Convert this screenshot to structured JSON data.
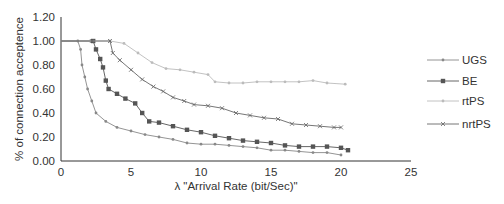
{
  "chart_data": {
    "type": "line",
    "title": "",
    "xlabel": "λ \"Arrival Rate (bit/Sec)\"",
    "ylabel": "% of connection acceptence",
    "xlim": [
      0,
      25
    ],
    "ylim": [
      0,
      1.2
    ],
    "x_ticks": [
      "0",
      "5",
      "10",
      "15",
      "20",
      "25"
    ],
    "y_ticks": [
      "0.00",
      "0.20",
      "0.40",
      "0.60",
      "0.80",
      "1.00",
      "1.20"
    ],
    "grid": false,
    "legend_position": "right",
    "series": [
      {
        "name": "UGS",
        "color": "#888888",
        "marker": "dot",
        "points": [
          [
            0,
            1.0
          ],
          [
            1.2,
            1.0
          ],
          [
            1.4,
            0.93
          ],
          [
            1.5,
            0.8
          ],
          [
            1.7,
            0.7
          ],
          [
            1.9,
            0.6
          ],
          [
            2.2,
            0.5
          ],
          [
            2.5,
            0.4
          ],
          [
            3.2,
            0.33
          ],
          [
            4,
            0.28
          ],
          [
            5,
            0.25
          ],
          [
            6,
            0.22
          ],
          [
            7,
            0.2
          ],
          [
            8,
            0.18
          ],
          [
            9,
            0.15
          ],
          [
            10,
            0.14
          ],
          [
            11,
            0.14
          ],
          [
            12,
            0.13
          ],
          [
            13,
            0.12
          ],
          [
            14,
            0.11
          ],
          [
            15,
            0.09
          ],
          [
            16,
            0.09
          ],
          [
            17,
            0.08
          ],
          [
            18,
            0.07
          ],
          [
            19,
            0.07
          ],
          [
            20,
            0.05
          ]
        ]
      },
      {
        "name": "BE",
        "color": "#555555",
        "marker": "square",
        "points": [
          [
            0,
            1.0
          ],
          [
            2.3,
            1.0
          ],
          [
            2.5,
            0.93
          ],
          [
            2.8,
            0.85
          ],
          [
            3.0,
            0.78
          ],
          [
            3.2,
            0.67
          ],
          [
            3.4,
            0.6
          ],
          [
            4.0,
            0.56
          ],
          [
            4.6,
            0.52
          ],
          [
            5.3,
            0.48
          ],
          [
            5.8,
            0.4
          ],
          [
            6.3,
            0.33
          ],
          [
            7,
            0.32
          ],
          [
            8,
            0.29
          ],
          [
            9,
            0.26
          ],
          [
            10,
            0.24
          ],
          [
            11,
            0.21
          ],
          [
            12,
            0.19
          ],
          [
            13,
            0.17
          ],
          [
            14,
            0.16
          ],
          [
            15,
            0.15
          ],
          [
            16,
            0.13
          ],
          [
            17,
            0.12
          ],
          [
            18,
            0.12
          ],
          [
            19,
            0.12
          ],
          [
            20,
            0.11
          ],
          [
            20.5,
            0.09
          ]
        ]
      },
      {
        "name": "rtPS",
        "color": "#bbbbbb",
        "marker": "dot",
        "points": [
          [
            0,
            1.0
          ],
          [
            3.5,
            1.0
          ],
          [
            4.5,
            0.98
          ],
          [
            5.5,
            0.9
          ],
          [
            6.5,
            0.82
          ],
          [
            7.5,
            0.77
          ],
          [
            8.5,
            0.76
          ],
          [
            9.5,
            0.74
          ],
          [
            10.5,
            0.72
          ],
          [
            11,
            0.66
          ],
          [
            12,
            0.65
          ],
          [
            13,
            0.65
          ],
          [
            14,
            0.66
          ],
          [
            15,
            0.66
          ],
          [
            16,
            0.66
          ],
          [
            17,
            0.66
          ],
          [
            18,
            0.67
          ],
          [
            19,
            0.65
          ],
          [
            20.3,
            0.64
          ]
        ]
      },
      {
        "name": "nrtPS",
        "color": "#666666",
        "marker": "x",
        "points": [
          [
            0,
            1.0
          ],
          [
            2.2,
            1.0
          ],
          [
            3.5,
            1.0
          ],
          [
            3.7,
            0.9
          ],
          [
            4.2,
            0.84
          ],
          [
            5,
            0.76
          ],
          [
            5.8,
            0.68
          ],
          [
            6.6,
            0.62
          ],
          [
            7.3,
            0.58
          ],
          [
            8,
            0.53
          ],
          [
            8.8,
            0.5
          ],
          [
            9.5,
            0.47
          ],
          [
            10.5,
            0.46
          ],
          [
            11.5,
            0.44
          ],
          [
            12.5,
            0.4
          ],
          [
            13.5,
            0.38
          ],
          [
            14.5,
            0.36
          ],
          [
            15.5,
            0.35
          ],
          [
            16.5,
            0.31
          ],
          [
            17.5,
            0.3
          ],
          [
            18.5,
            0.29
          ],
          [
            19.5,
            0.28
          ],
          [
            20,
            0.28
          ]
        ]
      }
    ]
  }
}
